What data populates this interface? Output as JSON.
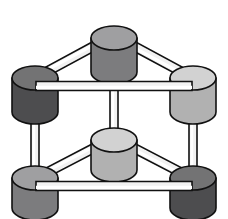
{
  "canvas": {
    "width": 228,
    "height": 219,
    "background": "#ffffff",
    "title": "3D cylinder node lattice"
  },
  "style": {
    "outline_color": "#111111",
    "outline_width": 1.6,
    "strut_fill": "#f2f2f2",
    "strut_highlight": "#ffffff",
    "node_top_lighten": 0.16,
    "node_side_darken": 0.12
  },
  "palette": {
    "dark_gray": "#58585a",
    "medium_gray": "#8d8d8f",
    "light_gray": "#c9c9c9",
    "outline": "#111111",
    "white": "#ffffff"
  },
  "nodes": [
    {
      "id": "top-center",
      "label": "top-center-node",
      "cx": 114,
      "cy": 38,
      "rx": 23,
      "ry": 12,
      "body_height": 34,
      "shade": "medium",
      "fill": "#8d8d8f",
      "tier": "upper"
    },
    {
      "id": "left-rear",
      "label": "left-rear-node",
      "cx": 35,
      "cy": 78,
      "rx": 23,
      "ry": 12,
      "body_height": 34,
      "shade": "dark",
      "fill": "#58585a",
      "tier": "upper"
    },
    {
      "id": "right-rear",
      "label": "right-rear-node",
      "cx": 193,
      "cy": 78,
      "rx": 23,
      "ry": 12,
      "body_height": 34,
      "shade": "light",
      "fill": "#c9c9c9",
      "tier": "upper"
    },
    {
      "id": "center-lower",
      "label": "center-lower-node",
      "cx": 114,
      "cy": 140,
      "rx": 23,
      "ry": 12,
      "body_height": 30,
      "shade": "light",
      "fill": "#c9c9c9",
      "tier": "lower"
    },
    {
      "id": "bottom-left",
      "label": "bottom-left-node",
      "cx": 35,
      "cy": 178,
      "rx": 23,
      "ry": 12,
      "body_height": 30,
      "shade": "medium",
      "fill": "#8d8d8f",
      "tier": "lower"
    },
    {
      "id": "bottom-right",
      "label": "bottom-right-node",
      "cx": 193,
      "cy": 178,
      "rx": 23,
      "ry": 12,
      "body_height": 30,
      "shade": "dark",
      "fill": "#58585a",
      "tier": "lower"
    }
  ],
  "struts": [
    {
      "id": "upper-diag-left",
      "label": "strut-top-center-to-left-rear",
      "from": "top-center",
      "to": "left-rear",
      "x1": 98,
      "y1": 44,
      "x2": 48,
      "y2": 71,
      "thickness": 9,
      "kind": "diagonal",
      "layer": "back"
    },
    {
      "id": "upper-diag-right",
      "label": "strut-top-center-to-right-rear",
      "from": "top-center",
      "to": "right-rear",
      "x1": 130,
      "y1": 44,
      "x2": 180,
      "y2": 71,
      "thickness": 9,
      "kind": "diagonal",
      "layer": "back"
    },
    {
      "id": "upper-cross-bar",
      "label": "strut-left-rear-to-right-rear",
      "from": "left-rear",
      "to": "right-rear",
      "x1": 36,
      "y1": 86,
      "x2": 192,
      "y2": 86,
      "thickness": 9,
      "kind": "horizontal",
      "layer": "front"
    },
    {
      "id": "vertical-left",
      "label": "strut-left-rear-to-bottom-left",
      "from": "left-rear",
      "to": "bottom-left",
      "x1": 35,
      "y1": 88,
      "x2": 35,
      "y2": 176,
      "thickness": 8,
      "kind": "vertical",
      "layer": "back"
    },
    {
      "id": "vertical-right",
      "label": "strut-right-rear-to-bottom-right",
      "from": "right-rear",
      "to": "bottom-right",
      "x1": 193,
      "y1": 88,
      "x2": 193,
      "y2": 176,
      "thickness": 8,
      "kind": "vertical",
      "layer": "back"
    },
    {
      "id": "vertical-center",
      "label": "strut-top-center-to-center-lower",
      "from": "top-center",
      "to": "center-lower",
      "x1": 114,
      "y1": 52,
      "x2": 114,
      "y2": 142,
      "thickness": 8,
      "kind": "vertical",
      "layer": "back"
    },
    {
      "id": "lower-diag-left",
      "label": "strut-center-lower-to-bottom-left",
      "from": "center-lower",
      "to": "bottom-left",
      "x1": 98,
      "y1": 146,
      "x2": 48,
      "y2": 172,
      "thickness": 9,
      "kind": "diagonal",
      "layer": "back"
    },
    {
      "id": "lower-diag-right",
      "label": "strut-center-lower-to-bottom-right",
      "from": "center-lower",
      "to": "bottom-right",
      "x1": 130,
      "y1": 146,
      "x2": 180,
      "y2": 172,
      "thickness": 9,
      "kind": "diagonal",
      "layer": "back"
    },
    {
      "id": "lower-cross-bar",
      "label": "strut-bottom-left-to-bottom-right",
      "from": "bottom-left",
      "to": "bottom-right",
      "x1": 36,
      "y1": 186,
      "x2": 192,
      "y2": 186,
      "thickness": 9,
      "kind": "horizontal",
      "layer": "front"
    }
  ],
  "counts": {
    "nodes": 6,
    "struts": 9
  }
}
